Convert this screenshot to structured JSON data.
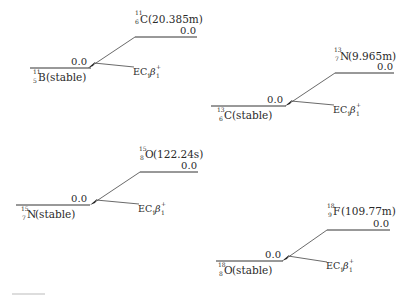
{
  "diagram": {
    "title": "",
    "decays": [
      {
        "parent": {
          "mass": "11",
          "z": "6",
          "symbol": "C",
          "halflife": "(20.385m)",
          "level": "0.0"
        },
        "daughter": {
          "mass": "11",
          "z": "5",
          "symbol": "B",
          "halflife": "(stable)",
          "level": "0.0"
        },
        "mode": {
          "ec": "EC",
          "ec_sub": "1",
          "beta": "β",
          "beta_sup": "+",
          "beta_sub": "1"
        }
      },
      {
        "parent": {
          "mass": "13",
          "z": "7",
          "symbol": "N",
          "halflife": "(9.965m)",
          "level": "0.0"
        },
        "daughter": {
          "mass": "13",
          "z": "6",
          "symbol": "C",
          "halflife": "(stable)",
          "level": "0.0"
        },
        "mode": {
          "ec": "EC",
          "ec_sub": "1",
          "beta": "β",
          "beta_sup": "+",
          "beta_sub": "1"
        }
      },
      {
        "parent": {
          "mass": "15",
          "z": "8",
          "symbol": "O",
          "halflife": "(122.24s)",
          "level": "0.0"
        },
        "daughter": {
          "mass": "15",
          "z": "7",
          "symbol": "N",
          "halflife": "(stable)",
          "level": "0.0"
        },
        "mode": {
          "ec": "EC",
          "ec_sub": "1",
          "beta": "β",
          "beta_sup": "+",
          "beta_sub": "1"
        }
      },
      {
        "parent": {
          "mass": "18",
          "z": "9",
          "symbol": "F",
          "halflife": "(109.77m)",
          "level": "0.0"
        },
        "daughter": {
          "mass": "18",
          "z": "8",
          "symbol": "O",
          "halflife": "(stable)",
          "level": "0.0"
        },
        "mode": {
          "ec": "EC",
          "ec_sub": "1",
          "beta": "β",
          "beta_sup": "+",
          "beta_sub": "1"
        }
      }
    ]
  }
}
